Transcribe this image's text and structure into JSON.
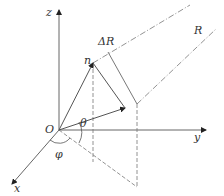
{
  "diagram": {
    "type": "3d-coordinate-geometry",
    "labels": {
      "z_axis": "z",
      "y_axis": "y",
      "x_axis": "x",
      "origin": "O",
      "theta": "θ",
      "phi": "φ",
      "n": "n",
      "delta_r": "ΔR",
      "r": "R"
    },
    "colors": {
      "line": "#555555",
      "text": "#333333",
      "background": "#ffffff"
    }
  }
}
